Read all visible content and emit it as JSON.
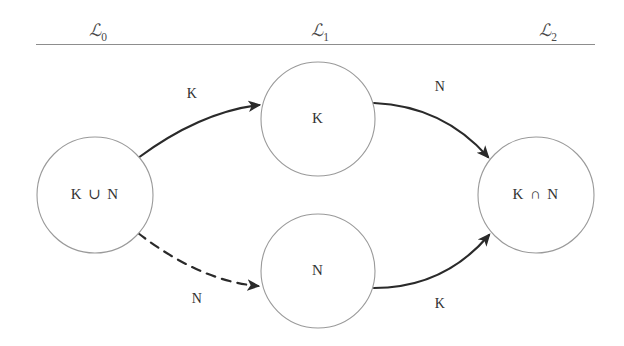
{
  "figure": {
    "background_color": "#ffffff",
    "line_color": "#2a2a2a",
    "node_stroke_color": "#9a9a9a",
    "rule_color": "#8d8d8d"
  },
  "header": {
    "rule_visible": true,
    "columns": [
      {
        "id": "level-0",
        "glyph": "ℒ",
        "subscript": "0",
        "text": "ℒ0"
      },
      {
        "id": "level-1",
        "glyph": "ℒ",
        "subscript": "1",
        "text": "ℒ1"
      },
      {
        "id": "level-2",
        "glyph": "ℒ",
        "subscript": "2",
        "text": "ℒ2"
      }
    ]
  },
  "nodes": [
    {
      "id": "node-union",
      "label": "K ∪ N",
      "cx": 95,
      "cy": 195,
      "r": 58,
      "level": "ℒ0"
    },
    {
      "id": "node-k",
      "label": "K",
      "cx": 318,
      "cy": 119,
      "r": 57,
      "level": "ℒ1"
    },
    {
      "id": "node-n",
      "label": "N",
      "cx": 318,
      "cy": 271,
      "r": 57,
      "level": "ℒ1"
    },
    {
      "id": "node-intersection",
      "label": "K ∩ N",
      "cx": 536,
      "cy": 195,
      "r": 58,
      "level": "ℒ2"
    }
  ],
  "edges": [
    {
      "id": "edge-union-to-k",
      "label": "K",
      "style": "solid",
      "from": "node-union",
      "to": "node-k",
      "path": "M 138 158 Q 200 112 259 105",
      "label_x": 192,
      "label_y": 95
    },
    {
      "id": "edge-union-to-n",
      "label": "N",
      "style": "dashed",
      "from": "node-union",
      "to": "node-n",
      "path": "M 138 233 Q 200 281 258 286",
      "label_x": 197,
      "label_y": 300
    },
    {
      "id": "edge-k-to-intersection",
      "label": "N",
      "style": "solid",
      "from": "node-k",
      "to": "node-intersection",
      "path": "M 374 103 Q 443 106 488 157",
      "label_x": 440,
      "label_y": 88
    },
    {
      "id": "edge-n-to-intersection",
      "label": "K",
      "style": "solid",
      "from": "node-n",
      "to": "node-intersection",
      "path": "M 374 288 Q 444 288 489 235",
      "label_x": 440,
      "label_y": 305
    }
  ]
}
